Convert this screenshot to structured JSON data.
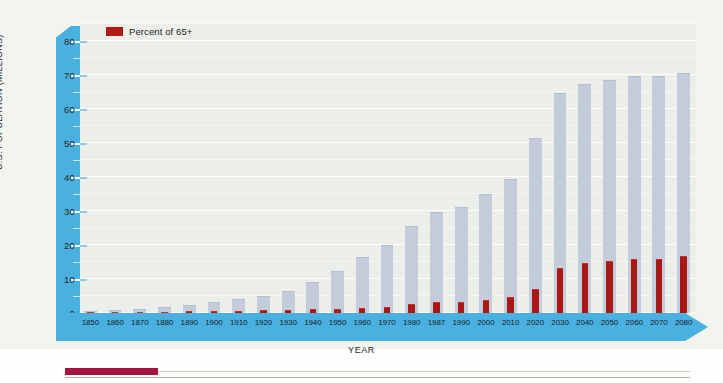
{
  "chart_data": {
    "type": "bar",
    "title": "",
    "subtitle": "",
    "xlabel": "YEAR",
    "ylabel": "U.S. POPULATION (MILLIONS)",
    "ylim": [
      0,
      85
    ],
    "yticks": [
      0,
      10,
      20,
      30,
      40,
      50,
      60,
      70,
      80
    ],
    "ytick_labels": [
      "0",
      "10",
      "20",
      "30",
      "40",
      "50",
      "60",
      "70",
      "80"
    ],
    "minor_tick_step": 5,
    "grid": true,
    "legend_position": "top-left",
    "categories": [
      "1850",
      "1860",
      "1870",
      "1880",
      "1890",
      "1900",
      "1910",
      "1920",
      "1930",
      "1940",
      "1950",
      "1960",
      "1970",
      "1980",
      "1987",
      "1990",
      "2000",
      "2010",
      "2020",
      "2030",
      "2040",
      "2050",
      "2060",
      "2070",
      "2080"
    ],
    "series": [
      {
        "name": "U.S. population 65+ (millions)",
        "color": "#c4ccda",
        "values": [
          0.6,
          0.9,
          1.2,
          1.7,
          2.4,
          3.1,
          4.0,
          4.9,
          6.6,
          9.0,
          12.3,
          16.6,
          20.1,
          25.5,
          29.8,
          31.2,
          34.9,
          39.4,
          51.4,
          64.6,
          67.4,
          68.5,
          69.8,
          69.8,
          70.7
        ]
      },
      {
        "name": "Percent of 65+",
        "color": "#a81916",
        "values": [
          2.5,
          2.7,
          3.0,
          3.4,
          3.9,
          4.1,
          4.3,
          4.7,
          5.4,
          6.8,
          8.1,
          9.2,
          9.8,
          11.3,
          12.2,
          12.5,
          12.6,
          13.0,
          16.3,
          20.1,
          21.2,
          21.7,
          22.0,
          22.3,
          22.6
        ],
        "drawn_values": [
          0.4,
          0.4,
          0.4,
          0.4,
          0.5,
          0.6,
          0.7,
          0.8,
          0.9,
          1.1,
          1.3,
          1.6,
          1.8,
          2.6,
          3.1,
          3.3,
          3.8,
          4.6,
          7.0,
          13.3,
          14.6,
          15.2,
          15.8,
          16.0,
          16.9
        ]
      }
    ]
  },
  "legend": {
    "label": "Percent of 65+",
    "swatch_color": "#a81916"
  },
  "axes": {
    "y_title": "U.S. POPULATION (MILLIONS)",
    "x_title": "YEAR",
    "axis_band_color": "#49b0e0"
  }
}
